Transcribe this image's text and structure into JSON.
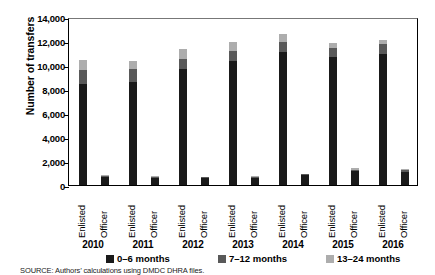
{
  "chart_data": {
    "type": "bar",
    "title": "",
    "xlabel": "",
    "ylabel": "Number of transfers",
    "ylim": [
      0,
      14000
    ],
    "ytick_labels": [
      "0",
      "2,000",
      "4,000",
      "6,000",
      "8,000",
      "10,000",
      "12,000",
      "14,000"
    ],
    "ytick_values": [
      0,
      2000,
      4000,
      6000,
      8000,
      10000,
      12000,
      14000
    ],
    "grid": false,
    "stacked": true,
    "legend_position": "bottom",
    "groups": [
      "2010",
      "2011",
      "2012",
      "2013",
      "2014",
      "2015",
      "2016"
    ],
    "categories": [
      "Enlisted",
      "Officer",
      "Enlisted",
      "Officer",
      "Enlisted",
      "Officer",
      "Enlisted",
      "Officer",
      "Enlisted",
      "Officer",
      "Enlisted",
      "Officer",
      "Enlisted",
      "Officer"
    ],
    "series": [
      {
        "name": "0–6 months",
        "color": "#1a1a1a",
        "values": [
          8400,
          700,
          8600,
          620,
          9700,
          580,
          10300,
          600,
          11100,
          800,
          10700,
          1150,
          10900,
          1100
        ]
      },
      {
        "name": "7–12 months",
        "color": "#595959",
        "values": [
          1150,
          80,
          1050,
          70,
          800,
          60,
          900,
          70,
          800,
          90,
          700,
          130,
          850,
          130
        ]
      },
      {
        "name": "13–24 months",
        "color": "#adadad",
        "values": [
          850,
          60,
          700,
          50,
          800,
          50,
          700,
          50,
          700,
          70,
          400,
          120,
          350,
          120
        ]
      }
    ],
    "totals": [
      10400,
      840,
      10350,
      740,
      11300,
      690,
      11900,
      720,
      12600,
      960,
      11800,
      1400,
      12100,
      1350
    ],
    "annotations": []
  },
  "legend": {
    "items": [
      {
        "label": "0–6 months",
        "color": "#1a1a1a"
      },
      {
        "label": "7–12 months",
        "color": "#595959"
      },
      {
        "label": "13–24 months",
        "color": "#adadad"
      }
    ]
  },
  "source": {
    "text": "SOURCE: Authors’ calculations using DMDC DHRA files."
  }
}
